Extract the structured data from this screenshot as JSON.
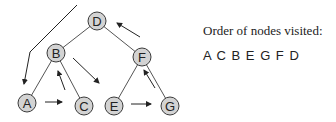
{
  "diagram": {
    "type": "binary-tree-traversal",
    "nodes": [
      {
        "id": "D",
        "label": "D"
      },
      {
        "id": "B",
        "label": "B"
      },
      {
        "id": "F",
        "label": "F"
      },
      {
        "id": "A",
        "label": "A"
      },
      {
        "id": "C",
        "label": "C"
      },
      {
        "id": "E",
        "label": "E"
      },
      {
        "id": "G",
        "label": "G"
      }
    ],
    "edges": [
      [
        "D",
        "B"
      ],
      [
        "D",
        "F"
      ],
      [
        "B",
        "A"
      ],
      [
        "B",
        "C"
      ],
      [
        "F",
        "E"
      ],
      [
        "F",
        "G"
      ]
    ],
    "traversal_arrows": [
      {
        "from": "start",
        "to": "A"
      },
      {
        "from": "A",
        "to": "C"
      },
      {
        "from": "C",
        "to": "B"
      },
      {
        "from": "B",
        "to": "E"
      },
      {
        "from": "E",
        "to": "G"
      },
      {
        "from": "G",
        "to": "F"
      },
      {
        "from": "F",
        "to": "D"
      }
    ]
  },
  "caption": "Order of nodes visited:",
  "order": "A C B E G F D"
}
